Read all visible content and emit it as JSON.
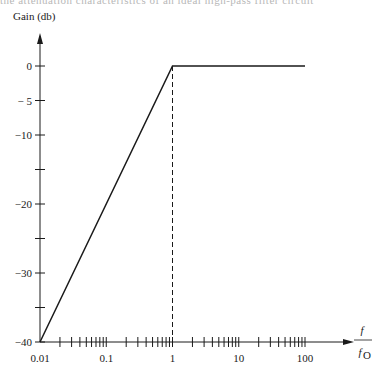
{
  "chart_data": {
    "type": "line",
    "title": "",
    "ylabel": "Gain (db)",
    "xlabel": "f / f0",
    "xlabel_numerator": "f",
    "xlabel_denominator": "f",
    "xlabel_subscript": "O",
    "xscale": "log",
    "xlim": [
      0.01,
      100
    ],
    "ylim": [
      -40,
      0
    ],
    "x_tick_labels": [
      "0.01",
      "0.1",
      "1",
      "10",
      "100"
    ],
    "x_ticks": [
      0.01,
      0.1,
      1,
      10,
      100
    ],
    "y_ticks": [
      0,
      -5,
      -10,
      -15,
      -20,
      -25,
      -30,
      -35,
      -40
    ],
    "y_tick_labels": [
      "0",
      "− 5",
      "−10",
      "",
      "−20",
      "",
      "−30",
      "",
      "−40"
    ],
    "grid": false,
    "legend": null,
    "series": [
      {
        "name": "Gain",
        "x": [
          0.01,
          1,
          100
        ],
        "y": [
          -40,
          0,
          0
        ],
        "style": "solid"
      }
    ],
    "annotations": [
      {
        "type": "vertical-dashed-line",
        "x": 1,
        "from_y": -40,
        "to_y": 0
      }
    ]
  },
  "header_text": "the attenuation characteristics of an ideal high-pass filter circuit"
}
